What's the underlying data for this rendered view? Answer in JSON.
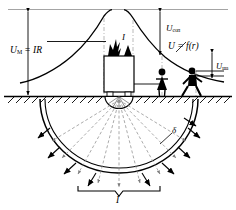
{
  "figure": {
    "kind": "engineering-diagram"
  },
  "labels": {
    "u_max": {
      "main": "U",
      "sub": "М",
      "rest": " = IR"
    },
    "u_contact": {
      "main": "U",
      "sub": "соп"
    },
    "u_curve": "U = f(r)",
    "u_step": {
      "main": "U",
      "sub": "ша"
    },
    "fault_current": "I",
    "total_current": "I",
    "current_density": "δ"
  },
  "elements": {
    "reference_line": "zero-potential-reference-line",
    "ground_line": "ground-surface-line",
    "equipment": "faulted-equipment-box",
    "arc": "fault-arc-symbol",
    "electrode": "hemispherical-grounding-electrode",
    "potential_curve": "potential-distribution-curve",
    "spread_zone": "current-spreading-hemisphere",
    "person_standing": "person-standing-touching",
    "person_walking": "person-walking-step-voltage",
    "brace": "total-current-brace"
  },
  "colors": {
    "ink": "#000000",
    "faint": "#9a9a9a",
    "hatch": "#1a1a1a",
    "paper": "#ffffff"
  }
}
